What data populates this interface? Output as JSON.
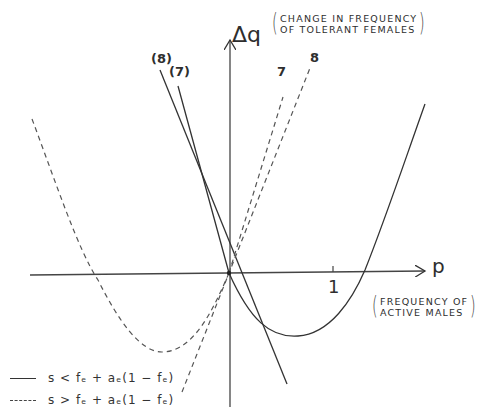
{
  "diagram": {
    "y_axis": {
      "symbol": "Δq",
      "description_line1": "CHANGE IN FREQUENCY",
      "description_line2": "OF TOLERANT FEMALES"
    },
    "x_axis": {
      "symbol": "p",
      "description_line1": "FREQUENCY OF",
      "description_line2": "ACTIVE MALES",
      "tick_label": "1"
    },
    "line_tags": {
      "solid_8": "(8)",
      "solid_7": "(7)",
      "dashed_7": "7",
      "dashed_8": "8"
    },
    "legend": [
      {
        "style": "solid",
        "label": "s < f_f + a_f(1 − f_f)",
        "display": "s < fₑ + aₑ(1 − fₑ)"
      },
      {
        "style": "dashed",
        "label": "s > f_f + a_f(1 − f_f)",
        "display": "s > fₑ + aₑ(1 − fₑ)"
      }
    ],
    "colors": {
      "ink": "#333333",
      "background": "#ffffff"
    },
    "curves": [
      {
        "name": "solid-parabola",
        "style": "solid",
        "description": "parabola through origin, minimum right of origin, crossing p-axis right of p=1"
      },
      {
        "name": "dashed-parabola",
        "style": "dashed",
        "description": "parabola through origin, minimum left of origin, crossing p-axis at negative p"
      },
      {
        "name": "solid-tangent-8",
        "style": "solid",
        "description": "steep negative slope line through origin"
      },
      {
        "name": "solid-tangent-7",
        "style": "solid",
        "description": "negative slope line through origin"
      },
      {
        "name": "dashed-tangent-7",
        "style": "dashed",
        "description": "positive slope line through origin"
      },
      {
        "name": "dashed-tangent-8",
        "style": "dashed",
        "description": "positive slope line through origin"
      }
    ]
  }
}
